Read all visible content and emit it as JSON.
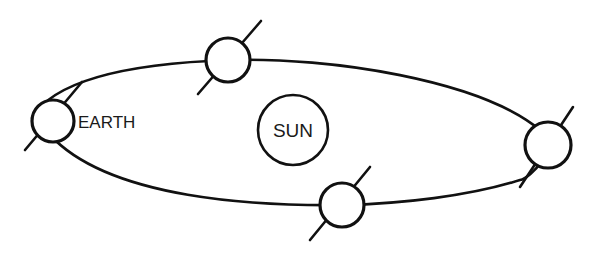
{
  "diagram": {
    "colors": {
      "line": "#111111",
      "background": "#ffffff"
    },
    "sun": {
      "label": "SUN",
      "cx": 293,
      "cy": 130,
      "r": 35
    },
    "orbit": {
      "path": "M 32 118 C 60 70, 170 62, 230 60 C 330 57, 480 80, 540 130 C 560 150, 530 178, 520 180 C 470 196, 400 204, 342 205 C 260 206, 110 200, 50 135 C 40 127, 32 122, 32 118 Z"
    },
    "earths": [
      {
        "id": "left",
        "label": "EARTH",
        "cx": 53,
        "cy": 121,
        "r": 21,
        "axis": [
          25,
          150,
          82,
          82
        ]
      },
      {
        "id": "top",
        "label": "",
        "cx": 228,
        "cy": 60,
        "r": 22,
        "axis": [
          198,
          94,
          261,
          21
        ]
      },
      {
        "id": "right",
        "label": "",
        "cx": 548,
        "cy": 145,
        "r": 23,
        "axis": [
          520,
          187,
          573,
          107
        ]
      },
      {
        "id": "bottom",
        "label": "",
        "cx": 342,
        "cy": 205,
        "r": 22,
        "axis": [
          310,
          240,
          370,
          167
        ]
      }
    ]
  }
}
